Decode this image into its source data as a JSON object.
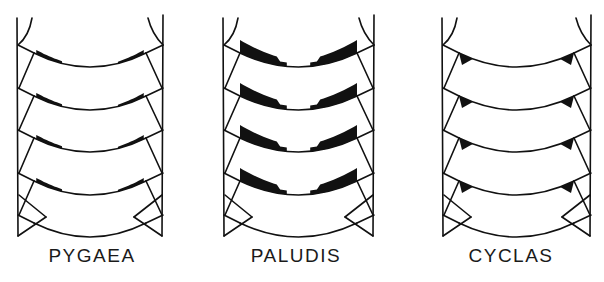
{
  "figure": {
    "ink_color": "#111111",
    "background": "#ffffff",
    "panels": [
      {
        "id": "pygaea",
        "label": "PYGAEA",
        "x0": 17,
        "x1": 163,
        "label_x": 92,
        "pattern": "short dark bars near lateral margins"
      },
      {
        "id": "paludis",
        "label": "PALUDIS",
        "x0": 223,
        "x1": 374,
        "label_x": 296,
        "pattern": "broad dark band notched at midline"
      },
      {
        "id": "cyclas",
        "label": "CYCLAS",
        "x0": 442,
        "x1": 591,
        "label_x": 511,
        "pattern": "dark triangles at lateral corners"
      }
    ],
    "segments": 4
  }
}
